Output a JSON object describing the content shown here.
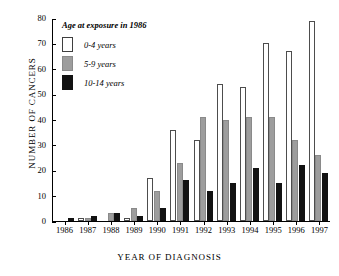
{
  "chart_data": {
    "type": "bar",
    "title": "",
    "xlabel": "YEAR OF DIAGNOSIS",
    "ylabel": "NUMBER  OF  CANCERS",
    "categories": [
      "1986",
      "1987",
      "1988",
      "1989",
      "1990",
      "1991",
      "1992",
      "1993",
      "1994",
      "1995",
      "1996",
      "1997"
    ],
    "series": [
      {
        "name": "0-4 years",
        "values": [
          0,
          1,
          0,
          1,
          17,
          36,
          32,
          54,
          53,
          70,
          67,
          79
        ]
      },
      {
        "name": "5-9 years",
        "values": [
          0,
          1,
          3,
          5,
          12,
          23,
          41,
          40,
          41,
          41,
          32,
          26
        ]
      },
      {
        "name": "10-14 years",
        "values": [
          1,
          2,
          3,
          2,
          5,
          16,
          12,
          15,
          21,
          15,
          22,
          19
        ]
      }
    ],
    "ylim": [
      0,
      80
    ],
    "yticks": [
      0,
      10,
      20,
      30,
      40,
      50,
      60,
      70,
      80
    ],
    "ytick_labels": [
      "0",
      "10",
      "20",
      "30",
      "40",
      "50",
      "60",
      "70",
      "80"
    ],
    "grid": false,
    "legend_position": "top-left",
    "legend_title": "Age at exposure in 1986",
    "colors": {
      "series_0": "#ffffff",
      "series_1": "#9d9d9d",
      "series_2": "#121212",
      "axis": "#000000",
      "background": "#ffffff"
    }
  }
}
